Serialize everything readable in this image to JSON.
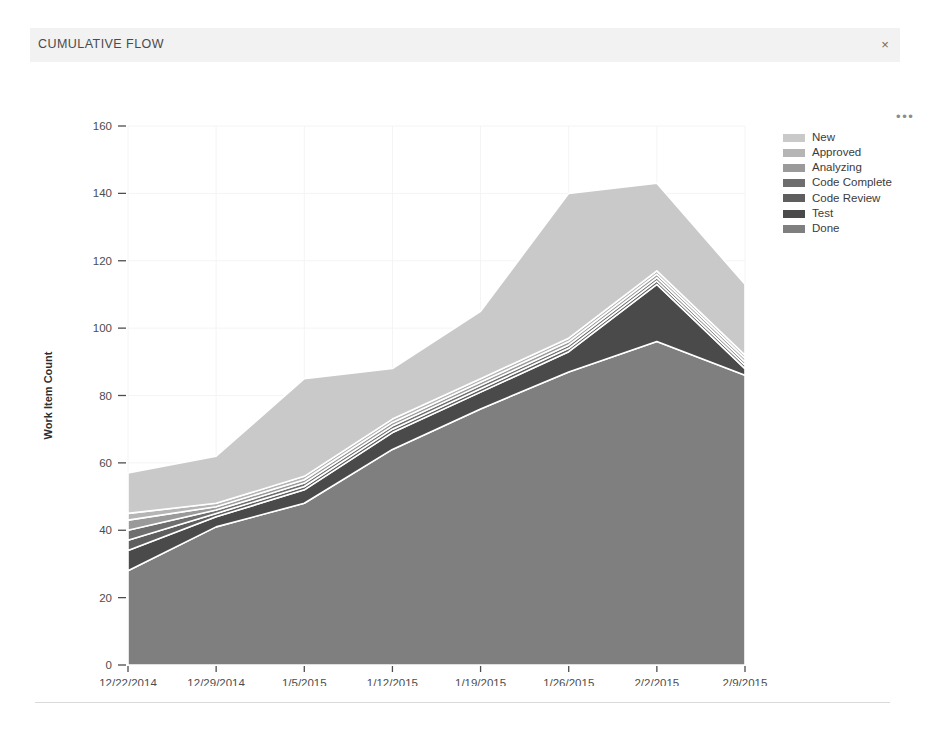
{
  "card": {
    "title": "CUMULATIVE FLOW",
    "close_label": "×",
    "close_icon": "close-icon",
    "more_label": "•••",
    "more_icon": "ellipsis-icon"
  },
  "chart_data": {
    "type": "area",
    "title": "CUMULATIVE FLOW",
    "xlabel": "",
    "ylabel": "Work Item Count",
    "stacked": true,
    "grid": true,
    "legend_position": "right",
    "ylim": [
      0,
      160
    ],
    "yticks": [
      0,
      20,
      40,
      60,
      80,
      100,
      120,
      140,
      160
    ],
    "categories": [
      "12/22/2014",
      "12/29/2014",
      "1/5/2015",
      "1/12/2015",
      "1/19/2015",
      "1/26/2015",
      "2/2/2015",
      "2/9/2015"
    ],
    "series": [
      {
        "name": "Done",
        "color": "#7f7f7f",
        "values": [
          28,
          41,
          48,
          64,
          76,
          87,
          96,
          86
        ]
      },
      {
        "name": "Test",
        "color": "#4a4a4a",
        "values": [
          6,
          3,
          4,
          5,
          5,
          6,
          17,
          2
        ]
      },
      {
        "name": "Code Review",
        "color": "#5e5e5e",
        "values": [
          3,
          1,
          1,
          1,
          1,
          1,
          1,
          1
        ]
      },
      {
        "name": "Code Complete",
        "color": "#6e6e6e",
        "values": [
          3,
          1,
          1,
          1,
          1,
          1,
          1,
          1
        ]
      },
      {
        "name": "Analyzing",
        "color": "#9a9a9a",
        "values": [
          3,
          1,
          1,
          1,
          1,
          1,
          1,
          1
        ]
      },
      {
        "name": "Approved",
        "color": "#b5b5b5",
        "values": [
          2,
          1,
          1,
          1,
          1,
          1,
          1,
          1
        ]
      },
      {
        "name": "New",
        "color": "#c9c9c9",
        "values": [
          12,
          14,
          29,
          15,
          20,
          43,
          26,
          21
        ]
      }
    ],
    "legend_order": [
      "New",
      "Approved",
      "Analyzing",
      "Code Complete",
      "Code Review",
      "Test",
      "Done"
    ],
    "totals": [
      57,
      62,
      85,
      88,
      105,
      140,
      143,
      113
    ]
  }
}
